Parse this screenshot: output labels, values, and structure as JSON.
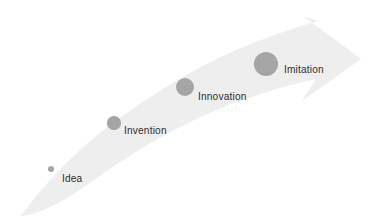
{
  "diagram": {
    "type": "progression-arrow",
    "title": "",
    "background_color": "#ffffff",
    "arrow": {
      "name": "upward-curved-arrow",
      "fill_color": "#eeeeee",
      "direction": "left-to-right, ascending",
      "tail_point": [
        20,
        216
      ],
      "head_tip": [
        361,
        59
      ]
    },
    "stages": [
      {
        "id": "idea",
        "label": "Idea",
        "dot": {
          "cx": 51,
          "cy": 169,
          "r": 3.4,
          "color": "#a5a5a5"
        },
        "label_pos": {
          "x": 62,
          "y": 173
        }
      },
      {
        "id": "invention",
        "label": "Invention",
        "dot": {
          "cx": 114,
          "cy": 123,
          "r": 6.6,
          "color": "#a5a5a5"
        },
        "label_pos": {
          "x": 124,
          "y": 125
        }
      },
      {
        "id": "innovation",
        "label": "Innovation",
        "dot": {
          "cx": 185,
          "cy": 87,
          "r": 9.2,
          "color": "#a5a5a5"
        },
        "label_pos": {
          "x": 198,
          "y": 91
        }
      },
      {
        "id": "imitation",
        "label": "Imitation",
        "dot": {
          "cx": 266,
          "cy": 64,
          "r": 12.4,
          "color": "#a5a5a5"
        },
        "label_pos": {
          "x": 284,
          "y": 64
        }
      }
    ],
    "colors": {
      "arrow": "#eeeeee",
      "node": "#a5a5a5",
      "text": "#2e2e2e",
      "background": "#ffffff"
    }
  }
}
